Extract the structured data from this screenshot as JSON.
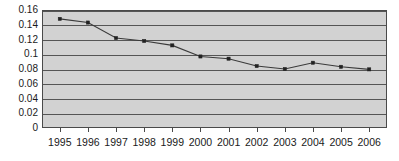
{
  "chart_data": {
    "type": "line",
    "title": "",
    "subtitle": "",
    "xlabel": "",
    "ylabel": "",
    "categories": [
      "1995",
      "1996",
      "1997",
      "1998",
      "1999",
      "2000",
      "2001",
      "2002",
      "2003",
      "2004",
      "2005",
      "2006"
    ],
    "x": [
      1995,
      1996,
      1997,
      1998,
      1999,
      2000,
      2001,
      2002,
      2003,
      2004,
      2005,
      2006
    ],
    "values": [
      0.148,
      0.143,
      0.122,
      0.118,
      0.112,
      0.097,
      0.094,
      0.084,
      0.08,
      0.0885,
      0.083,
      0.0795
    ],
    "series": [
      {
        "name": "series-1",
        "values": [
          0.148,
          0.143,
          0.122,
          0.118,
          0.112,
          0.097,
          0.094,
          0.084,
          0.08,
          0.0885,
          0.083,
          0.0795
        ]
      }
    ],
    "ylim": [
      0,
      0.16
    ],
    "yticks": [
      0,
      0.02,
      0.04,
      0.06,
      0.08,
      0.1,
      0.12,
      0.14,
      0.16
    ],
    "ytick_labels": [
      "0",
      "0.02",
      "0.04",
      "0.06",
      "0.08",
      "0.1",
      "0.12",
      "0.14",
      "0.16"
    ],
    "grid": true,
    "grid_axis": "y",
    "legend": false,
    "legend_position": "none",
    "marker": "square",
    "plot_background_color": "#d2d2d2",
    "line_color": "#3a3a3a",
    "marker_color": "#222222",
    "gridline_color": "#555555",
    "border_color": "#4a4a4a",
    "text_color": "#1a1a1a"
  }
}
